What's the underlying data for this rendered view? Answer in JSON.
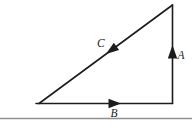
{
  "figure": {
    "vectors": [
      {
        "label": "A",
        "side": "right-vertical",
        "direction": "up"
      },
      {
        "label": "B",
        "side": "bottom-horizontal",
        "direction": "right"
      },
      {
        "label": "C",
        "side": "hypotenuse",
        "direction": "down-left"
      }
    ],
    "labels": {
      "a": "A",
      "b": "B",
      "c": "C"
    },
    "colors": {
      "line": "#1c1c1c",
      "divider": "#909090",
      "background": "#ffffff"
    }
  }
}
